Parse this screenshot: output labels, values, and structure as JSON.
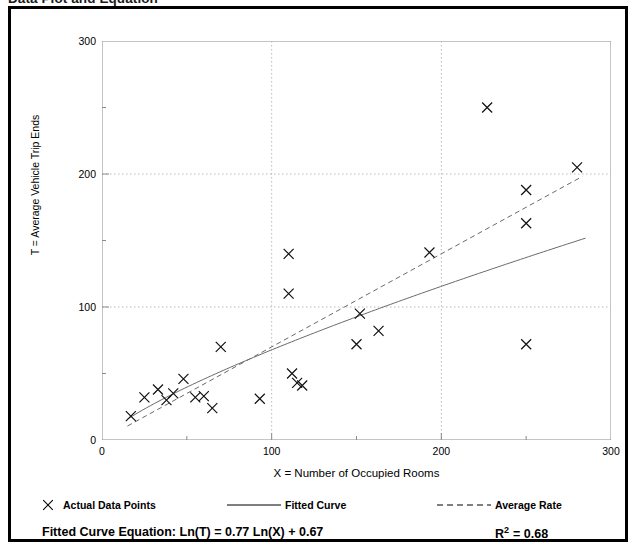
{
  "figure": {
    "title": "Data Plot and Equation"
  },
  "legend": [
    {
      "id": "actual-data-points",
      "label": "Actual Data Points",
      "marker": "cross-marker-icon",
      "color": "#000000"
    },
    {
      "id": "fitted-curve",
      "label": "Fitted Curve",
      "marker": "solid-line-icon",
      "color": "#000000"
    },
    {
      "id": "average-rate",
      "label": "Average Rate",
      "marker": "dashed-line-icon",
      "color": "#000000"
    }
  ],
  "equation": {
    "prefix": "Fitted Curve Equation:",
    "formula": "Ln(T) = 0.77 Ln(X) + 0.67",
    "full": "Fitted Curve Equation:  Ln(T) = 0.77 Ln(X) + 0.67",
    "r_squared_label": "R",
    "r_squared_exponent": "2",
    "r_squared_value": "= 0.68",
    "r_squared_full": "R2 = 0.68"
  },
  "chart_data": {
    "type": "scatter",
    "title": "Data Plot and Equation",
    "xlabel": "X = Number of Occupied Rooms",
    "ylabel": "T = Average Vehicle Trip Ends",
    "xlim": [
      0,
      300
    ],
    "ylim": [
      0,
      300
    ],
    "xticks": [
      0,
      100,
      200,
      300
    ],
    "yticks": [
      0,
      100,
      200,
      300
    ],
    "xticks_minor": [
      50,
      150,
      250
    ],
    "yticks_minor": [
      50,
      150,
      250
    ],
    "xtick_labels": [
      "0",
      "100",
      "200",
      "300"
    ],
    "ytick_labels": [
      "0",
      "100",
      "200",
      "300"
    ],
    "grid": "dotted gridlines at x=100,200 and y=100,200",
    "legend_position": "below-axes",
    "series": [
      {
        "name": "Actual Data Points",
        "type": "scatter",
        "marker": "x",
        "color": "#000000",
        "points": [
          [
            17,
            18
          ],
          [
            25,
            32
          ],
          [
            33,
            38
          ],
          [
            38,
            30
          ],
          [
            42,
            35
          ],
          [
            48,
            46
          ],
          [
            55,
            32
          ],
          [
            60,
            33
          ],
          [
            65,
            24
          ],
          [
            70,
            70
          ],
          [
            93,
            31
          ],
          [
            110,
            140
          ],
          [
            110,
            110
          ],
          [
            112,
            50
          ],
          [
            115,
            43
          ],
          [
            118,
            41
          ],
          [
            150,
            72
          ],
          [
            152,
            95
          ],
          [
            163,
            82
          ],
          [
            193,
            141
          ],
          [
            227,
            250
          ],
          [
            250,
            188
          ],
          [
            250,
            163
          ],
          [
            250,
            72
          ],
          [
            280,
            205
          ]
        ]
      },
      {
        "name": "Fitted Curve",
        "type": "line",
        "style": "solid",
        "color": "#555555",
        "equation": "Ln(T) = 0.77 Ln(X) + 0.67",
        "coefficient": 0.77,
        "intercept": 0.67,
        "x_start": 15,
        "x_end": 285
      },
      {
        "name": "Average Rate",
        "type": "line",
        "style": "dashed",
        "color": "#555555",
        "slope": 0.7,
        "intercept": 0,
        "x_start": 15,
        "x_end": 283
      }
    ]
  }
}
